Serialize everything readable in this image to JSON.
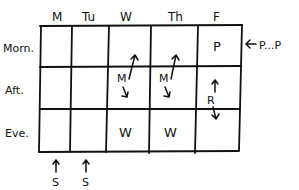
{
  "diagram": {
    "type": "weekly-schedule-grid",
    "columns": [
      "M",
      "Tu",
      "W",
      "Th",
      "F"
    ],
    "rows": [
      "Morn.",
      "Aft.",
      "Eve."
    ],
    "cells": {
      "friday_morning": "P",
      "wednesday_afternoon": "M",
      "thursday_afternoon": "M",
      "friday_afternoon": "R",
      "wednesday_evening": "W",
      "thursday_evening": "W"
    },
    "annotations": {
      "right_of_friday_morning": "P...P",
      "below_monday": "S",
      "below_tuesday": "S"
    },
    "colors": {
      "ink": "#111111",
      "background": "#ffffff"
    }
  }
}
